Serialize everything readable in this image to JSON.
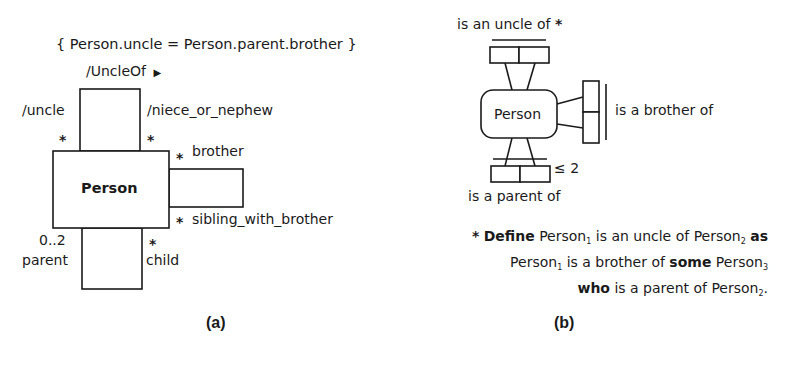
{
  "panel_a": {
    "constraint": "{ Person.uncle = Person.parent.brother }",
    "association_name": "/UncleOf",
    "direction_arrow": "▶",
    "class_name": "Person",
    "roles": {
      "uncle": {
        "name": "/uncle",
        "multiplicity": "*"
      },
      "niece_or_nephew": {
        "name": "/niece_or_nephew",
        "multiplicity": "*"
      },
      "brother": {
        "name": "brother",
        "multiplicity": "*"
      },
      "sibling_with_brother": {
        "name": "sibling_with_brother",
        "multiplicity": "*"
      },
      "parent": {
        "name": "parent",
        "multiplicity": "0..2"
      },
      "child": {
        "name": "child",
        "multiplicity": "*"
      }
    },
    "caption": "(a)"
  },
  "panel_b": {
    "entity_name": "Person",
    "fact_types": {
      "uncle": {
        "reading": "is an uncle of",
        "derived_mark": "*"
      },
      "brother": {
        "reading": "is a brother of"
      },
      "parent": {
        "reading": "is a parent of",
        "frequency_constraint": "≤ 2"
      }
    },
    "definition": {
      "star": "*",
      "kw_define": "Define",
      "p1": "Person",
      "s1": "1",
      "t1": " is an uncle of ",
      "p2": "Person",
      "s2": "2",
      "kw_as": "as",
      "p3": "Person",
      "s3": "1",
      "t2": " is a brother of ",
      "kw_some": "some",
      "p4": "Person",
      "s4": "3",
      "kw_who": "who",
      "t3": " is a parent of ",
      "p5": "Person",
      "s5": "2",
      "end": "."
    },
    "caption": "(b)"
  }
}
